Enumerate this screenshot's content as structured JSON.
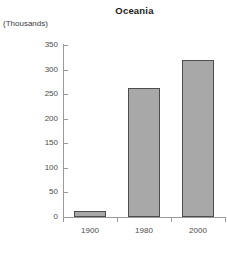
{
  "chart_data": {
    "type": "bar",
    "title": "Oceania",
    "subtitle": "",
    "unit_label": "(Thousands)",
    "xlabel": "",
    "ylabel": "",
    "categories": [
      "1900",
      "1980",
      "2000"
    ],
    "values": [
      12,
      262,
      320
    ],
    "series": [
      {
        "name": "Population",
        "values": [
          12,
          262,
          320
        ]
      }
    ],
    "ylim": [
      0,
      350
    ],
    "yticks": [
      0,
      50,
      100,
      150,
      200,
      250,
      300,
      350
    ],
    "ytick_labels": [
      "0",
      "50",
      "100",
      "150",
      "200",
      "250",
      "300",
      "350"
    ],
    "grid": false,
    "legend": false,
    "legend_position": "none",
    "colors": {
      "bar_fill": "#a8a8a8",
      "bar_border": "#4d4d4d",
      "axis": "#9a9a9a",
      "tick_text": "#4a4a4a",
      "title_text": "#1a1a1a",
      "background": "#ffffff"
    }
  }
}
